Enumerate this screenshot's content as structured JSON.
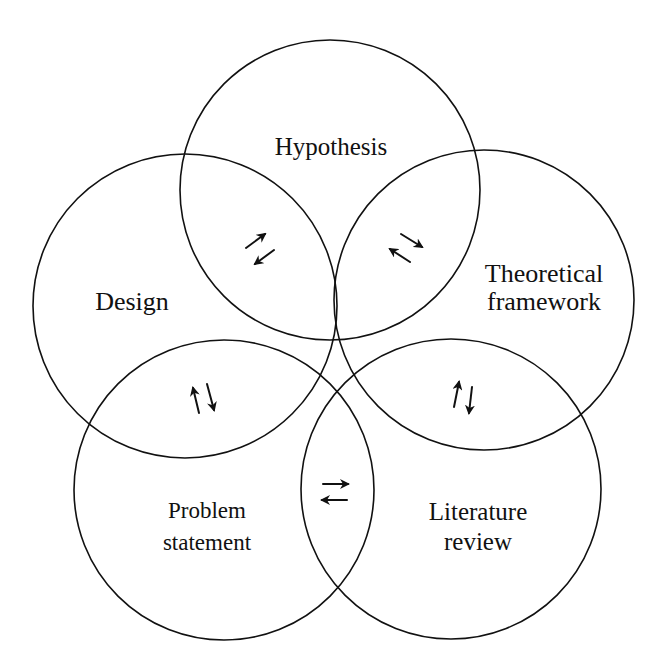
{
  "diagram": {
    "background": "#ffffff",
    "stroke_color": "#111111",
    "nodes": [
      {
        "id": "hypothesis",
        "lines": [
          "Hypothesis"
        ],
        "cx": 330,
        "cy": 190,
        "r": 150
      },
      {
        "id": "theoretical-framework",
        "lines": [
          "Theoretical",
          "framework"
        ],
        "cx": 484,
        "cy": 300,
        "r": 150
      },
      {
        "id": "literature-review",
        "lines": [
          "Literature",
          "review"
        ],
        "cx": 451,
        "cy": 489,
        "r": 150
      },
      {
        "id": "problem-statement",
        "lines": [
          "Problem",
          "statement"
        ],
        "cx": 224,
        "cy": 490,
        "r": 150
      },
      {
        "id": "design",
        "lines": [
          "Design"
        ],
        "cx": 185,
        "cy": 306,
        "r": 152
      }
    ],
    "bidirectional_links": [
      {
        "between": [
          "design",
          "hypothesis"
        ],
        "symbol": "⇅ (diagonal)"
      },
      {
        "between": [
          "hypothesis",
          "theoretical-framework"
        ],
        "symbol": "⇅ (diagonal)"
      },
      {
        "between": [
          "theoretical-framework",
          "literature-review"
        ],
        "symbol": "↑↓"
      },
      {
        "between": [
          "literature-review",
          "problem-statement"
        ],
        "symbol": "⇄"
      },
      {
        "between": [
          "problem-statement",
          "design"
        ],
        "symbol": "↑↓"
      }
    ]
  }
}
